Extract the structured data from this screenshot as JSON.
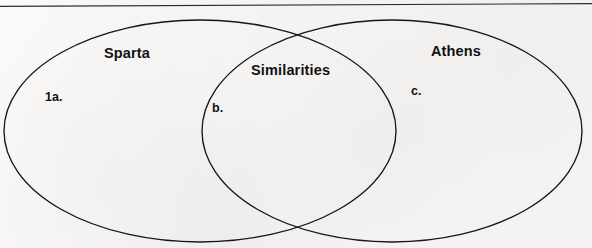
{
  "worksheet": {
    "type": "venn-diagram",
    "background_color": "#f4f3f1",
    "ink_color": "#111111",
    "rule": {
      "name": "page-rule",
      "color": "#2b2b2b"
    },
    "sets": [
      {
        "id": "sparta",
        "label": "Sparta",
        "marker": "1a."
      },
      {
        "id": "athens",
        "label": "Athens",
        "marker": "c."
      }
    ],
    "overlap": {
      "id": "similarities",
      "label": "Similarities",
      "marker": "b."
    }
  }
}
